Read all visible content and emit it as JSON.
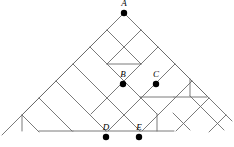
{
  "figure": {
    "type": "lattice-diagram",
    "title": "",
    "width": 234,
    "height": 147,
    "background_color": "#ffffff",
    "line_color": "#6b6b6b",
    "line_width": 0.9,
    "vertex_color": "#000000",
    "vertex_radius": 3.2,
    "label_color": "#000000"
  },
  "labels": {
    "A": "A",
    "B": "B",
    "C": "C",
    "D": "D",
    "E": "E"
  },
  "vertices": [
    {
      "id": "A",
      "label": "A",
      "x": 124,
      "y": 13,
      "label_dx": 0,
      "label_dy": -5
    },
    {
      "id": "B",
      "label": "B",
      "x": 123,
      "y": 84,
      "label_dx": 0,
      "label_dy": -5
    },
    {
      "id": "C",
      "label": "C",
      "x": 156,
      "y": 84,
      "label_dx": 0,
      "label_dy": -5
    },
    {
      "id": "D",
      "label": "D",
      "x": 106,
      "y": 137,
      "label_dx": 0,
      "label_dy": -5
    },
    {
      "id": "E",
      "label": "E",
      "x": 139,
      "y": 137,
      "label_dx": 0,
      "label_dy": -5
    }
  ],
  "segments": [
    {
      "name": "apex-left-outer",
      "x1": 124,
      "y1": 13,
      "x2": 2,
      "y2": 135
    },
    {
      "name": "apex-right-outer",
      "x1": 124,
      "y1": 13,
      "x2": 232,
      "y2": 121
    },
    {
      "name": "d1-a",
      "x1": 107,
      "y1": 30,
      "x2": 141,
      "y2": 64
    },
    {
      "name": "d1-b",
      "x1": 90,
      "y1": 47,
      "x2": 157,
      "y2": 114
    },
    {
      "name": "d1-c",
      "x1": 73,
      "y1": 64,
      "x2": 140,
      "y2": 131
    },
    {
      "name": "d1-d",
      "x1": 56,
      "y1": 81,
      "x2": 106,
      "y2": 131
    },
    {
      "name": "d1-e",
      "x1": 39,
      "y1": 98,
      "x2": 72,
      "y2": 131
    },
    {
      "name": "d1-f",
      "x1": 22,
      "y1": 115,
      "x2": 39,
      "y2": 132
    },
    {
      "name": "d1-g",
      "x1": 140,
      "y1": 29,
      "x2": 190,
      "y2": 79
    },
    {
      "name": "d1-h",
      "x1": 157,
      "y1": 46,
      "x2": 207,
      "y2": 96
    },
    {
      "name": "d1-i",
      "x1": 174,
      "y1": 63,
      "x2": 207,
      "y2": 96
    },
    {
      "name": "d1-j",
      "x1": 190,
      "y1": 96,
      "x2": 207,
      "y2": 113
    },
    {
      "name": "d1-k",
      "x1": 173,
      "y1": 113,
      "x2": 190,
      "y2": 130
    },
    {
      "name": "d1-l",
      "x1": 207,
      "y1": 113,
      "x2": 224,
      "y2": 130
    },
    {
      "name": "d2-a",
      "x1": 141,
      "y1": 30,
      "x2": 107,
      "y2": 64
    },
    {
      "name": "d2-b",
      "x1": 158,
      "y1": 47,
      "x2": 91,
      "y2": 114
    },
    {
      "name": "d2-c",
      "x1": 175,
      "y1": 64,
      "x2": 108,
      "y2": 131
    },
    {
      "name": "d2-d",
      "x1": 192,
      "y1": 81,
      "x2": 142,
      "y2": 131
    },
    {
      "name": "d2-e",
      "x1": 209,
      "y1": 98,
      "x2": 176,
      "y2": 131
    },
    {
      "name": "d2-f",
      "x1": 226,
      "y1": 115,
      "x2": 209,
      "y2": 132
    },
    {
      "name": "d2-g",
      "x1": 107,
      "y1": 30,
      "x2": 57,
      "y2": 80
    },
    {
      "name": "d2-h",
      "x1": 90,
      "y1": 47,
      "x2": 40,
      "y2": 97
    },
    {
      "name": "d2-i",
      "x1": 73,
      "y1": 64,
      "x2": 23,
      "y2": 114
    },
    {
      "name": "d2-j",
      "x1": 56,
      "y1": 81,
      "x2": 23,
      "y2": 114
    },
    {
      "name": "d2-k",
      "x1": 39,
      "y1": 98,
      "x2": 22,
      "y2": 115
    },
    {
      "name": "inner-h1",
      "x1": 107,
      "y1": 64,
      "x2": 141,
      "y2": 64
    },
    {
      "name": "inner-h2",
      "x1": 140,
      "y1": 97,
      "x2": 174,
      "y2": 97
    },
    {
      "name": "inner-h3",
      "x1": 106,
      "y1": 131,
      "x2": 140,
      "y2": 131
    },
    {
      "name": "inner-h4",
      "x1": 140,
      "y1": 131,
      "x2": 174,
      "y2": 131
    },
    {
      "name": "inner-h5",
      "x1": 39,
      "y1": 131,
      "x2": 73,
      "y2": 131
    },
    {
      "name": "inner-h6",
      "x1": 73,
      "y1": 131,
      "x2": 106,
      "y2": 131
    },
    {
      "name": "inner-h7",
      "x1": 174,
      "y1": 97,
      "x2": 207,
      "y2": 97
    },
    {
      "name": "inner-v1",
      "x1": 157,
      "y1": 114,
      "x2": 157,
      "y2": 131
    },
    {
      "name": "inner-v2",
      "x1": 190,
      "y1": 79,
      "x2": 190,
      "y2": 96
    },
    {
      "name": "inner-v3",
      "x1": 22,
      "y1": 115,
      "x2": 22,
      "y2": 131
    }
  ]
}
